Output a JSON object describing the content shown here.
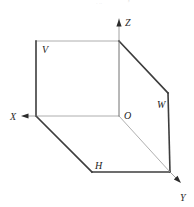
{
  "figure": {
    "width": 194,
    "height": 207,
    "background": "#ffffff",
    "top_remnant": {
      "text": "— ——  ——— ——  ————— ,  ————   —  ———",
      "text2": "· ··"
    },
    "colors": {
      "heavy_line": "#3d3d3d",
      "light_line": "#9a9a9a",
      "axis_line": "#8c8c8c",
      "label": "#222222",
      "arrow": "#2b2b2b"
    },
    "stroke_widths": {
      "heavy": 1.6,
      "light": 0.8,
      "axis": 0.8
    }
  },
  "points": {
    "O": {
      "x": 119,
      "y": 116,
      "label": "O"
    },
    "v_top_left": {
      "x": 36,
      "y": 41
    },
    "v_top_right": {
      "x": 119,
      "y": 41
    },
    "v_bottom_left": {
      "x": 36,
      "y": 116
    },
    "w_top": {
      "x": 168,
      "y": 93
    },
    "w_bottom": {
      "x": 170,
      "y": 172
    },
    "h_left": {
      "x": 92,
      "y": 172
    },
    "z_tip": {
      "x": 119,
      "y": 19
    },
    "y_tip": {
      "x": 181,
      "y": 183
    },
    "x_tip": {
      "x": 21,
      "y": 116
    }
  },
  "axes": [
    {
      "id": "z",
      "label": "Z",
      "label_x": 125,
      "label_y": 26,
      "arrow": "up",
      "name": "z-axis"
    },
    {
      "id": "x",
      "label": "X",
      "label_x": 10,
      "label_y": 120,
      "arrow": "left",
      "name": "x-axis"
    },
    {
      "id": "y",
      "label": "Y",
      "label_x": 180,
      "label_y": 201,
      "arrow": "down-right",
      "name": "y-axis"
    }
  ],
  "plane_labels": [
    {
      "id": "V",
      "label": "V",
      "x": 42,
      "y": 53,
      "name": "plane-label-v",
      "desc": "frontal plane"
    },
    {
      "id": "W",
      "label": "W",
      "x": 157,
      "y": 108,
      "name": "plane-label-w",
      "desc": "profile plane"
    },
    {
      "id": "H",
      "label": "H",
      "x": 95,
      "y": 169,
      "name": "plane-label-h",
      "desc": "horizontal plane"
    },
    {
      "id": "O",
      "label": "O",
      "x": 124,
      "y": 119,
      "name": "origin-label",
      "desc": "origin"
    }
  ],
  "edges": [
    {
      "id": "v-top",
      "kind": "light",
      "x1": 36,
      "y1": 41,
      "x2": 119,
      "y2": 41
    },
    {
      "id": "v-left",
      "kind": "heavy",
      "x1": 36,
      "y1": 41,
      "x2": 36,
      "y2": 116
    },
    {
      "id": "v-bottom",
      "kind": "light",
      "x1": 36,
      "y1": 116,
      "x2": 119,
      "y2": 116
    },
    {
      "id": "v-right",
      "kind": "light",
      "x1": 119,
      "y1": 41,
      "x2": 119,
      "y2": 116
    },
    {
      "id": "w-top-slant",
      "kind": "heavy",
      "x1": 119,
      "y1": 41,
      "x2": 168,
      "y2": 93
    },
    {
      "id": "w-right",
      "kind": "heavy",
      "x1": 168,
      "y1": 93,
      "x2": 170,
      "y2": 172
    },
    {
      "id": "h-left-slant",
      "kind": "heavy",
      "x1": 36,
      "y1": 116,
      "x2": 92,
      "y2": 172
    },
    {
      "id": "h-bottom",
      "kind": "heavy",
      "x1": 92,
      "y1": 172,
      "x2": 170,
      "y2": 172
    },
    {
      "id": "y-diagonal",
      "kind": "light",
      "x1": 119,
      "y1": 116,
      "x2": 170,
      "y2": 172
    },
    {
      "id": "z-vertical",
      "kind": "axis",
      "x1": 119,
      "y1": 19,
      "x2": 119,
      "y2": 116
    },
    {
      "id": "x-horizontal",
      "kind": "axis",
      "x1": 36,
      "y1": 116,
      "x2": 24,
      "y2": 116
    },
    {
      "id": "y-extension",
      "kind": "axis",
      "x1": 170,
      "y1": 172,
      "x2": 178,
      "y2": 180
    }
  ]
}
